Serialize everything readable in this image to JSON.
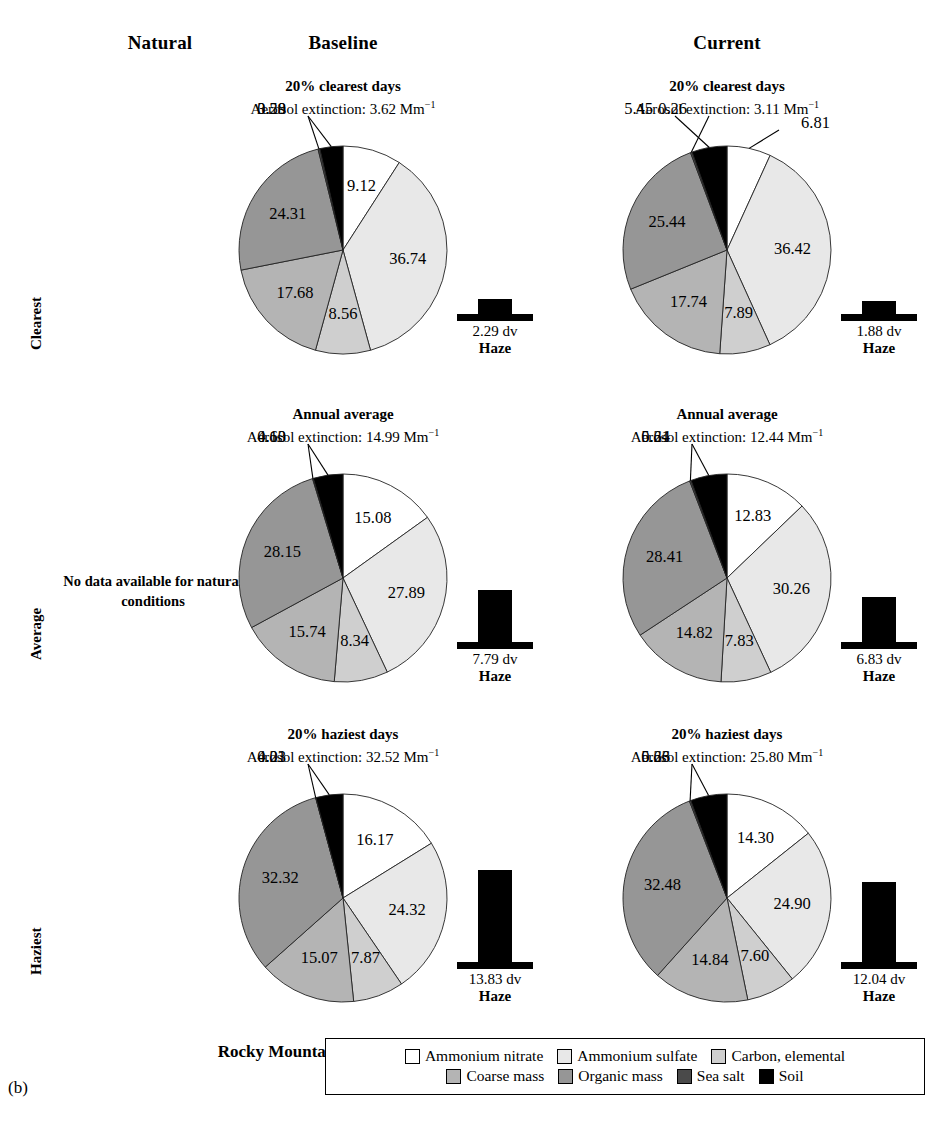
{
  "figure": {
    "panel_label": "(b)",
    "site_name": "Rocky Mountain",
    "columns": [
      "Natural",
      "Baseline",
      "Current"
    ],
    "rows": [
      "Clearest",
      "Average",
      "Haziest"
    ],
    "no_data_note": "No data available for natural conditions",
    "extinction_prefix": "Aerosol extinction: ",
    "extinction_unit": "Mm",
    "extinction_exponent": "−1",
    "haze_caption": "Haze",
    "haze_unit": "dv"
  },
  "legend": {
    "rows": [
      [
        {
          "label": "Ammonium nitrate",
          "color": "#ffffff"
        },
        {
          "label": "Ammonium sulfate",
          "color": "#e8e8e8"
        },
        {
          "label": "Carbon, elemental",
          "color": "#cfcfcf"
        }
      ],
      [
        {
          "label": "Coarse mass",
          "color": "#b4b4b4"
        },
        {
          "label": "Organic mass",
          "color": "#969696"
        },
        {
          "label": "Sea salt",
          "color": "#4a4a4a"
        },
        {
          "label": "Soil",
          "color": "#000000"
        }
      ]
    ]
  },
  "chart_data": {
    "type": "pie",
    "categories": [
      "Ammonium nitrate",
      "Ammonium sulfate",
      "Carbon, elemental",
      "Coarse mass",
      "Organic mass",
      "Sea salt",
      "Soil"
    ],
    "colors": [
      "#ffffff",
      "#e8e8e8",
      "#cfcfcf",
      "#b4b4b4",
      "#969696",
      "#4a4a4a",
      "#000000"
    ],
    "value_unit": "percent",
    "panels": [
      {
        "id": "baseline-clearest",
        "column": "Baseline",
        "row": "Clearest",
        "title": "20% clearest days",
        "extinction": "3.62",
        "values": [
          9.12,
          36.74,
          8.56,
          17.68,
          24.31,
          0.28,
          3.59
        ],
        "haze_value": "2.29",
        "haze_dv": 2.29
      },
      {
        "id": "current-clearest",
        "column": "Current",
        "row": "Clearest",
        "title": "20% clearest days",
        "extinction": "3.11",
        "values": [
          6.81,
          36.42,
          7.89,
          17.74,
          25.44,
          0.26,
          5.45
        ],
        "haze_value": "1.88",
        "haze_dv": 1.88
      },
      {
        "id": "baseline-average",
        "column": "Baseline",
        "row": "Average",
        "title": "Annual average",
        "extinction": "14.99",
        "values": [
          15.08,
          27.89,
          8.34,
          15.74,
          28.15,
          0.13,
          4.6
        ],
        "haze_value": "7.79",
        "haze_dv": 7.79
      },
      {
        "id": "current-average",
        "column": "Current",
        "row": "Average",
        "title": "Annual average",
        "extinction": "12.44",
        "values": [
          12.83,
          30.26,
          7.83,
          14.82,
          28.41,
          0.24,
          5.61
        ],
        "haze_value": "6.83",
        "haze_dv": 6.83
      },
      {
        "id": "baseline-haziest",
        "column": "Baseline",
        "row": "Haziest",
        "title": "20% haziest days",
        "extinction": "32.52",
        "values": [
          16.17,
          24.32,
          7.87,
          15.07,
          32.32,
          0.03,
          4.21
        ],
        "haze_value": "13.83",
        "haze_dv": 13.83
      },
      {
        "id": "current-haziest",
        "column": "Current",
        "row": "Haziest",
        "title": "20% haziest days",
        "extinction": "25.80",
        "values": [
          14.3,
          24.9,
          7.6,
          14.84,
          32.48,
          0.23,
          5.66
        ],
        "haze_value": "12.04",
        "haze_dv": 12.04
      }
    ]
  }
}
